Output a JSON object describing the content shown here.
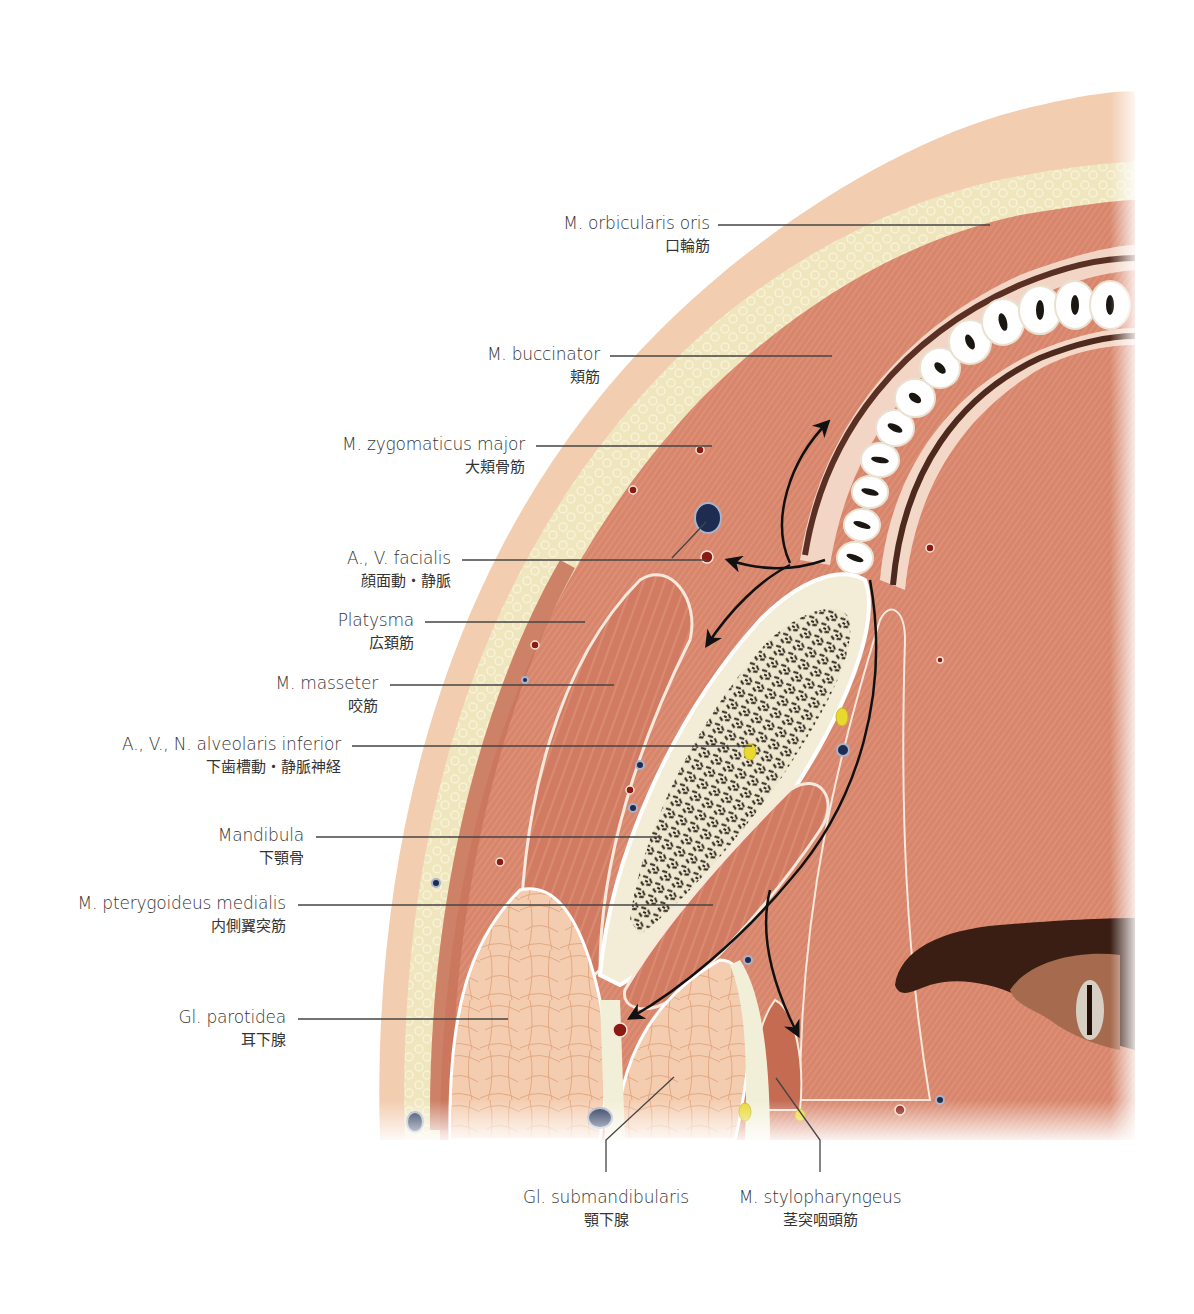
{
  "figure": {
    "type": "anatomical-cross-section",
    "region": "cheek / mandible horizontal section",
    "colors": {
      "skin": "#F2CDB0",
      "fat": "#EDE4B8",
      "muscle": "#D9836A",
      "muscle_dark": "#C46B52",
      "bone_cortex": "#F3EDD8",
      "bone_trabecular": "#3B3428",
      "gland": "#F2C8A8",
      "mucosa": "#F3D5C5",
      "artery": "#8B1A14",
      "vein": "#1E2C52",
      "nerve": "#E8D830",
      "leader_line": "#444444",
      "arrow": "#111111"
    }
  },
  "labels": [
    {
      "id": "orbicularis-oris",
      "en": "M. orbicularis oris",
      "jp": "口輪筋"
    },
    {
      "id": "buccinator",
      "en": "M. buccinator",
      "jp": "頬筋"
    },
    {
      "id": "zygomaticus-major",
      "en": "M. zygomaticus major",
      "jp": "大頬骨筋"
    },
    {
      "id": "facialis",
      "en": "A., V. facialis",
      "jp": "顔面動・静脈"
    },
    {
      "id": "platysma",
      "en": "Platysma",
      "jp": "広頚筋"
    },
    {
      "id": "masseter",
      "en": "M. masseter",
      "jp": "咬筋"
    },
    {
      "id": "alveolaris-inferior",
      "en": "A., V., N. alveolaris inferior",
      "jp": "下歯槽動・静脈神経"
    },
    {
      "id": "mandibula",
      "en": "Mandibula",
      "jp": "下顎骨"
    },
    {
      "id": "pterygoideus-medialis",
      "en": "M. pterygoideus medialis",
      "jp": "内側翼突筋"
    },
    {
      "id": "parotidea",
      "en": "Gl. parotidea",
      "jp": "耳下腺"
    },
    {
      "id": "submandibularis",
      "en": "Gl. submandibularis",
      "jp": "顎下腺"
    },
    {
      "id": "stylopharyngeus",
      "en": "M. stylopharyngeus",
      "jp": "茎突咽頭筋"
    }
  ]
}
